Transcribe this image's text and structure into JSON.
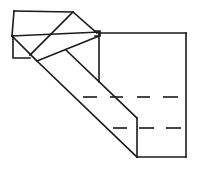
{
  "diagram": {
    "type": "origami-fold-line-diagram",
    "width": 203,
    "height": 170,
    "stroke_color": "#1a1a1a",
    "background": "#ffffff",
    "solid_lines": [
      {
        "name": "small-flap-top",
        "points": [
          [
            14,
            11
          ],
          [
            73,
            12
          ]
        ]
      },
      {
        "name": "small-flap-left",
        "points": [
          [
            14,
            11
          ],
          [
            12,
            36
          ]
        ]
      },
      {
        "name": "small-flap-lower-left",
        "points": [
          [
            13,
            36
          ],
          [
            13,
            58
          ],
          [
            30,
            58
          ]
        ]
      },
      {
        "name": "flap-diagonal-right",
        "points": [
          [
            73,
            12
          ],
          [
            97,
            33
          ]
        ]
      },
      {
        "name": "flap-diagonal-inner",
        "points": [
          [
            73,
            12
          ],
          [
            30,
            55
          ]
        ]
      },
      {
        "name": "cross-line",
        "points": [
          [
            12,
            36
          ],
          [
            99,
            32
          ]
        ]
      },
      {
        "name": "strip-left-edge-top",
        "points": [
          [
            12,
            36
          ],
          [
            37,
            61
          ]
        ]
      },
      {
        "name": "strip-top-edge",
        "points": [
          [
            37,
            61
          ],
          [
            99,
            36
          ]
        ]
      },
      {
        "name": "corner-square",
        "points": [
          [
            95,
            31
          ],
          [
            100,
            31
          ],
          [
            100,
            36
          ],
          [
            95,
            36
          ]
        ]
      },
      {
        "name": "main-square-top",
        "points": [
          [
            99,
            33
          ],
          [
            186,
            33
          ]
        ]
      },
      {
        "name": "main-square-right",
        "points": [
          [
            186,
            33
          ],
          [
            186,
            157
          ]
        ]
      },
      {
        "name": "main-square-bottom",
        "points": [
          [
            137,
            157
          ],
          [
            186,
            157
          ]
        ]
      },
      {
        "name": "inner-vertical-upper",
        "points": [
          [
            99,
            33
          ],
          [
            99,
            82
          ]
        ]
      },
      {
        "name": "strip-inner-diagonal",
        "points": [
          [
            66,
            50
          ],
          [
            137,
            118
          ]
        ]
      },
      {
        "name": "strip-inner-vertical",
        "points": [
          [
            137,
            118
          ],
          [
            137,
            157
          ]
        ]
      },
      {
        "name": "strip-outer-diagonal",
        "points": [
          [
            37,
            61
          ],
          [
            137,
            157
          ]
        ]
      }
    ],
    "dashed_lines": [
      {
        "name": "fold-line-upper",
        "y": 97,
        "segments": [
          [
            83,
            97
          ],
          [
            110,
            123
          ],
          [
            137,
            150
          ],
          [
            163,
            178
          ]
        ]
      },
      {
        "name": "fold-line-lower",
        "y": 128,
        "segments": [
          [
            113,
            127
          ],
          [
            139,
            154
          ],
          [
            166,
            181
          ]
        ]
      }
    ]
  }
}
